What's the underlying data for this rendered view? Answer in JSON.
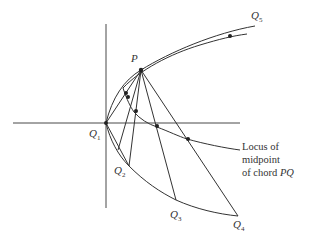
{
  "diagram": {
    "points": {
      "P": {
        "label": "P",
        "x": 141,
        "y": 70
      },
      "Q1": {
        "label": "Q",
        "sub": "1",
        "x": 106,
        "y": 123
      },
      "Q2": {
        "label": "Q",
        "sub": "2",
        "x": 129,
        "y": 166
      },
      "Q3": {
        "label": "Q",
        "sub": "3",
        "x": 176,
        "y": 200
      },
      "Q4": {
        "label": "Q",
        "sub": "4",
        "x": 238,
        "y": 216
      },
      "Q5": {
        "label": "Q",
        "sub": "5",
        "x": 255,
        "y": 26
      }
    },
    "caption": {
      "line1": "Locus of",
      "line2": "midpoint",
      "line3_prefix": "of chord ",
      "line3_var": "PQ"
    },
    "colors": {
      "stroke": "#333333",
      "background": "#ffffff"
    }
  }
}
